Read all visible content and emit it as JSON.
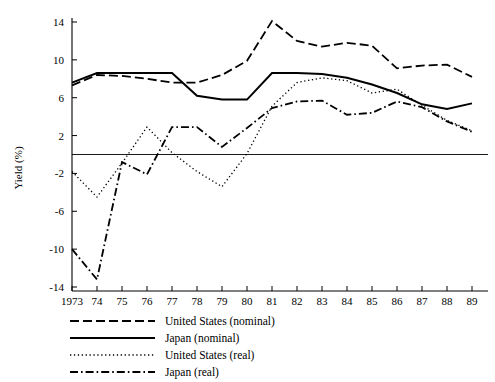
{
  "chart_data": {
    "type": "line",
    "title": "",
    "xlabel": "",
    "ylabel": "Yield (%)",
    "x": [
      1973,
      1974,
      1975,
      1976,
      1977,
      1978,
      1979,
      1980,
      1981,
      1982,
      1983,
      1984,
      1985,
      1986,
      1987,
      1988,
      1989
    ],
    "xtick_labels": [
      "1973",
      "74",
      "75",
      "76",
      "77",
      "78",
      "79",
      "80",
      "81",
      "82",
      "83",
      "84",
      "85",
      "86",
      "87",
      "88",
      "89"
    ],
    "ytick_labels": [
      "14",
      "10",
      "6",
      "2",
      "-2",
      "-6",
      "-10",
      "-14"
    ],
    "ytick_values": [
      14,
      10,
      6,
      2,
      -2,
      -6,
      -10,
      -14
    ],
    "ylim": [
      -14,
      15.2
    ],
    "xlim": [
      1973,
      1989.6
    ],
    "grid": false,
    "zero_line": 0,
    "legend_position": "below-left",
    "series": [
      {
        "name": "United States (nominal)",
        "style": "dashed",
        "values": [
          7.3,
          8.4,
          8.3,
          8.0,
          7.6,
          7.6,
          8.4,
          9.9,
          14.1,
          12.0,
          11.4,
          11.8,
          11.5,
          9.1,
          9.4,
          9.5,
          8.2
        ]
      },
      {
        "name": "Japan (nominal)",
        "style": "solid",
        "values": [
          7.6,
          8.6,
          8.6,
          8.6,
          8.6,
          6.2,
          5.8,
          5.8,
          8.6,
          8.6,
          8.5,
          8.1,
          7.4,
          6.5,
          5.3,
          4.8,
          5.4
        ]
      },
      {
        "name": "United States (real)",
        "style": "dotted",
        "values": [
          -1.8,
          -4.5,
          -0.9,
          2.9,
          0.2,
          -1.8,
          -3.4,
          0.1,
          5.1,
          7.6,
          8.1,
          7.8,
          6.5,
          6.9,
          5.2,
          3.6,
          2.5
        ]
      },
      {
        "name": "Japan (real)",
        "style": "dashdot",
        "values": [
          -10.0,
          -13.2,
          -0.8,
          -2.1,
          2.9,
          2.9,
          0.8,
          2.8,
          4.9,
          5.6,
          5.7,
          4.2,
          4.4,
          5.6,
          5.0,
          3.5,
          2.4
        ]
      }
    ]
  },
  "legend": {
    "items": [
      {
        "label": "United States (nominal)",
        "style": "dashed"
      },
      {
        "label": "Japan (nominal)",
        "style": "solid"
      },
      {
        "label": "United States (real)",
        "style": "dotted"
      },
      {
        "label": "Japan (real)",
        "style": "dashdot"
      }
    ]
  },
  "colors": {
    "line": "#000000",
    "axis": "#000000",
    "background": "#ffffff"
  }
}
